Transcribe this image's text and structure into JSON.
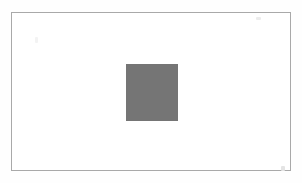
{
  "figure": {
    "title": "",
    "caption": "",
    "page_background": "#fefefe",
    "frame": {
      "name": "figure-frame",
      "border_color": "#a9a9a9",
      "border_width_px": 1,
      "fill_color": "#ffffff",
      "x": 11,
      "y": 12,
      "width": 280,
      "height": 159
    },
    "shapes": [
      {
        "name": "gray-square",
        "type": "rectangle",
        "fill_color": "#757575",
        "stroke": "none",
        "x": 126,
        "y": 64,
        "width": 52,
        "height": 57,
        "label": ""
      }
    ],
    "artifacts": [
      {
        "name": "speck-top-right",
        "color": "#ececec",
        "x": 256,
        "y": 17,
        "width": 5,
        "height": 3
      },
      {
        "name": "speck-bottom-right",
        "color": "#e4e4e4",
        "x": 281,
        "y": 166,
        "width": 4,
        "height": 5
      },
      {
        "name": "speck-left",
        "color": "#f3f3f3",
        "x": 35,
        "y": 37,
        "width": 3,
        "height": 6
      }
    ]
  },
  "colors": {
    "square_gray": "#757575",
    "frame_gray": "#a9a9a9",
    "paper_white": "#ffffff",
    "page_offwhite": "#fefefe"
  },
  "canvas": {
    "width": 302,
    "height": 183
  }
}
